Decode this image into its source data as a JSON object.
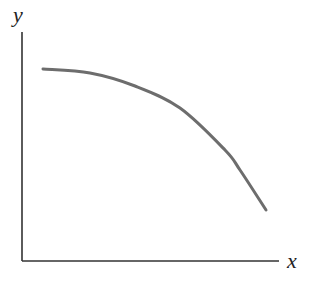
{
  "chart_data": {
    "type": "line",
    "title": "",
    "xlabel": "x",
    "ylabel": "y",
    "grid": false,
    "legend": null,
    "xticks": [],
    "yticks": [],
    "series": [
      {
        "name": "curve",
        "color": "#6d6d6d",
        "points_px": [
          [
            43,
            69
          ],
          [
            90,
            73
          ],
          [
            135,
            86
          ],
          [
            180,
            108
          ],
          [
            225,
            150
          ],
          [
            240,
            170
          ],
          [
            266,
            210
          ]
        ],
        "x_norm": [
          0.08,
          0.26,
          0.44,
          0.61,
          0.79,
          0.85,
          0.95
        ],
        "y_norm": [
          0.84,
          0.82,
          0.76,
          0.67,
          0.48,
          0.4,
          0.22
        ]
      }
    ],
    "axes": {
      "origin_px": [
        22,
        261
      ],
      "y_axis_top_px": [
        22,
        32
      ],
      "x_axis_right_px": [
        279,
        261
      ]
    }
  },
  "labels": {
    "x_axis": "x",
    "y_axis": "y"
  },
  "colors": {
    "axis": "#333333",
    "curve": "#6d6d6d",
    "background": "#ffffff"
  }
}
